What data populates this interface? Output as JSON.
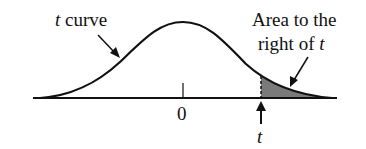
{
  "diagram": {
    "type": "t-distribution-right-tail",
    "curve_label": {
      "italic": "t",
      "text": " curve"
    },
    "area_label": {
      "line1": "Area to the",
      "line2_text": "right of ",
      "line2_italic": "t"
    },
    "center_tick_label": "0",
    "marker_label": "t",
    "colors": {
      "line": "#111111",
      "shade": "#7a7a7a"
    }
  }
}
